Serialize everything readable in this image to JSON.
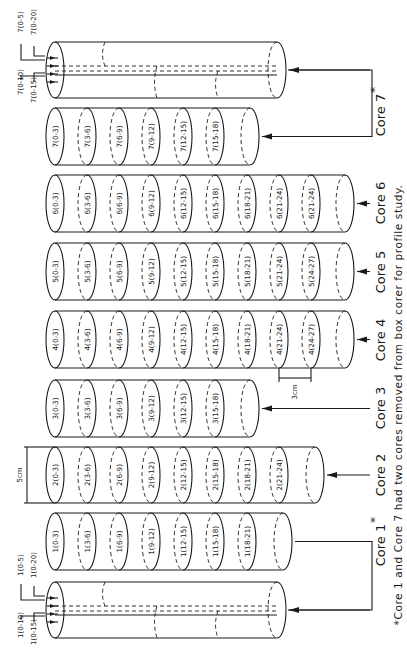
{
  "figure": {
    "caption": "*Core 1 and Core 7 had two cores removed from box corer for profile study.",
    "dimension_labels": {
      "diameter": "5cm",
      "slice_thickness": "3cm"
    },
    "cores": [
      {
        "id": "core-7-split",
        "label": "Core 7",
        "asterisk": "*",
        "type": "split",
        "sublabels": [
          "7(0-5)",
          "7(0-20)",
          "7(0-10)",
          "7(0-15)"
        ]
      },
      {
        "id": "core-7",
        "label": "",
        "type": "sliced",
        "slices": [
          "7(0-3)",
          "7(3-6)",
          "7(6-9)",
          "7(9-12)",
          "7(12-15)",
          "7(15-18)"
        ]
      },
      {
        "id": "core-6",
        "label": "Core 6",
        "type": "sliced",
        "slices": [
          "6(0-3)",
          "6(3-6)",
          "6(6-9)",
          "6(9-12)",
          "6(12-15)",
          "6(15-18)",
          "6(18-21)",
          "6(21-24)",
          "6(21-24)"
        ]
      },
      {
        "id": "core-5",
        "label": "Core 5",
        "type": "sliced",
        "slices": [
          "5(0-3)",
          "5(3-6)",
          "5(6-9)",
          "5(9-12)",
          "5(12-15)",
          "5(15-18)",
          "5(18-21)",
          "5(21-24)",
          "5(24-27)"
        ]
      },
      {
        "id": "core-4",
        "label": "Core 4",
        "type": "sliced",
        "slices": [
          "4(0-3)",
          "4(3-6)",
          "4(6-9)",
          "4(9-12)",
          "4(12-15)",
          "4(15-18)",
          "4(18-21)",
          "4(21-24)",
          "4(24-27)"
        ]
      },
      {
        "id": "core-3",
        "label": "Core 3",
        "type": "sliced",
        "slices": [
          "3(0-3)",
          "3(3-6)",
          "3(6-9)",
          "3(9-12)",
          "3(12-15)",
          "3(15-18)"
        ]
      },
      {
        "id": "core-2",
        "label": "Core 2",
        "type": "sliced",
        "slices": [
          "2(0-3)",
          "2(3-6)",
          "2(6-9)",
          "2(9-12)",
          "2(12-15)",
          "2(15-18)",
          "2(18-21)",
          "2(21-24)"
        ]
      },
      {
        "id": "core-1",
        "label": "",
        "type": "sliced",
        "slices": [
          "1(0-3)",
          "1(3-6)",
          "1(6-9)",
          "1(9-12)",
          "1(12-15)",
          "1(15-18)",
          "1(18-21)"
        ]
      },
      {
        "id": "core-1-split",
        "label": "Core 1",
        "asterisk": "*",
        "type": "split",
        "sublabels": [
          "1(0-5)",
          "1(0-20)",
          "1(0-10)",
          "1(0-15)"
        ]
      }
    ]
  }
}
